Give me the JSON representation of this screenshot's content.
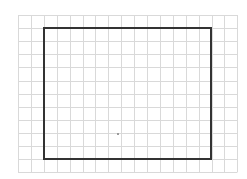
{
  "diagram": {
    "type": "grid-with-rectangle",
    "background": "#ffffff",
    "grid": {
      "left": 18,
      "top": 15,
      "cols": 17,
      "rows": 12,
      "cell_w": 12.9,
      "cell_h": 13.1,
      "line_color": "#d9d9d9"
    },
    "rectangle": {
      "x1": 44,
      "y1": 28,
      "x2": 211,
      "y2": 159,
      "stroke": "#333333",
      "stroke_width": 2
    },
    "dot": {
      "x": 117,
      "y": 133,
      "color": "#9a9a9a"
    }
  }
}
